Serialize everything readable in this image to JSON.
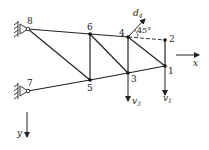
{
  "diagram": {
    "type": "truss",
    "nodes": [
      {
        "id": "1",
        "label": "1",
        "x": 165,
        "y": 66
      },
      {
        "id": "2",
        "label": "2",
        "x": 165,
        "y": 40
      },
      {
        "id": "3",
        "label": "3",
        "x": 128,
        "y": 73
      },
      {
        "id": "4",
        "label": "4",
        "x": 128,
        "y": 37
      },
      {
        "id": "5",
        "label": "5",
        "x": 90,
        "y": 80
      },
      {
        "id": "6",
        "label": "6",
        "x": 90,
        "y": 34
      },
      {
        "id": "7",
        "label": "7",
        "x": 28,
        "y": 91
      },
      {
        "id": "8",
        "label": "8",
        "x": 28,
        "y": 29
      }
    ],
    "members": [
      [
        "8",
        "6"
      ],
      [
        "6",
        "4"
      ],
      [
        "4",
        "2"
      ],
      [
        "7",
        "5"
      ],
      [
        "5",
        "3"
      ],
      [
        "3",
        "1"
      ],
      [
        "6",
        "5"
      ],
      [
        "4",
        "3"
      ],
      [
        "2",
        "1"
      ],
      [
        "8",
        "5"
      ],
      [
        "6",
        "3"
      ],
      [
        "4",
        "1"
      ]
    ],
    "supports": [
      {
        "node": "8",
        "type": "pin"
      },
      {
        "node": "7",
        "type": "pin"
      }
    ],
    "displacements": [
      {
        "label": "d",
        "subscript": "4",
        "node": "4",
        "direction": "45-degree"
      },
      {
        "label": "v",
        "subscript": "3",
        "node": "3",
        "direction": "down"
      },
      {
        "label": "v",
        "subscript": "1",
        "node": "1",
        "direction": "down"
      }
    ],
    "angle_label": "45°",
    "axes": {
      "x_label": "x",
      "y_label": "y"
    }
  }
}
